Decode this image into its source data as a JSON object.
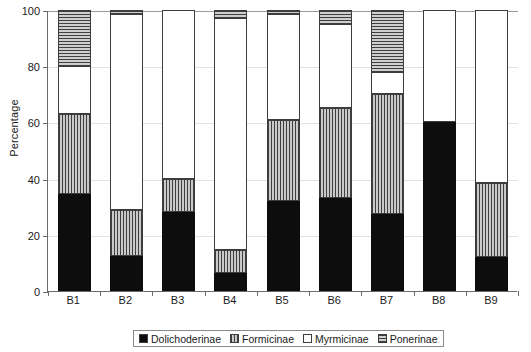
{
  "chart_data": {
    "type": "bar",
    "subtype": "stacked-bar-100",
    "title": "",
    "xlabel": "",
    "ylabel": "Percentage",
    "ylim": [
      0,
      100
    ],
    "yticks": [
      0,
      20,
      40,
      60,
      80,
      100
    ],
    "ytick_labels": [
      "0",
      "20",
      "40",
      "60",
      "80",
      "100"
    ],
    "grid": "horizontal-light",
    "legend_position": "bottom-center",
    "categories": [
      "B1",
      "B2",
      "B3",
      "B4",
      "B5",
      "B6",
      "B7",
      "B8",
      "B9"
    ],
    "series": [
      {
        "name": "Dolichoderinae",
        "pattern": "solid-black",
        "color": "#0d0d0d",
        "values": [
          34.5,
          12.5,
          28.0,
          6.5,
          32.0,
          33.0,
          27.5,
          60.0,
          12.0
        ]
      },
      {
        "name": "Formicinae",
        "pattern": "vertical-hatch",
        "color": "#a8a8a8",
        "values": [
          28.5,
          16.5,
          12.0,
          8.0,
          29.0,
          32.0,
          42.5,
          0.0,
          26.5
        ]
      },
      {
        "name": "Myrmicinae",
        "pattern": "white",
        "color": "#ffffff",
        "values": [
          17.0,
          69.5,
          60.0,
          82.5,
          37.5,
          30.0,
          8.0,
          40.0,
          61.5
        ]
      },
      {
        "name": "Ponerinae",
        "pattern": "horizontal-hatch",
        "color": "#b0b0b0",
        "values": [
          20.0,
          1.5,
          0.0,
          3.0,
          1.5,
          5.0,
          22.0,
          0.0,
          0.0
        ]
      }
    ],
    "cumulative_tops": {
      "B1": [
        34.5,
        63.0,
        80.0,
        100.0
      ],
      "B2": [
        12.5,
        29.0,
        98.5,
        100.0
      ],
      "B3": [
        28.0,
        40.0,
        100.0,
        100.0
      ],
      "B4": [
        6.5,
        14.5,
        97.0,
        100.0
      ],
      "B5": [
        32.0,
        61.0,
        98.5,
        100.0
      ],
      "B6": [
        33.0,
        65.0,
        95.0,
        100.0
      ],
      "B7": [
        27.5,
        70.0,
        78.0,
        100.0
      ],
      "B8": [
        60.0,
        60.0,
        100.0,
        100.0
      ],
      "B9": [
        12.0,
        38.5,
        100.0,
        100.0
      ]
    }
  },
  "legend": {
    "items": [
      {
        "label": "Dolichoderinae"
      },
      {
        "label": "Formicinae"
      },
      {
        "label": "Myrmicinae"
      },
      {
        "label": "Ponerinae"
      }
    ]
  }
}
